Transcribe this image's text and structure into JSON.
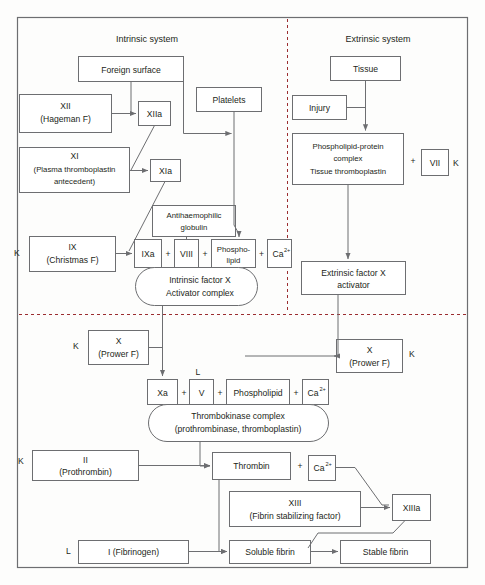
{
  "diagram": {
    "headings": {
      "intrinsic": "Intrinsic system",
      "extrinsic": "Extrinsic system"
    },
    "colors": {
      "box_stroke": "#6d6e71",
      "divider": "#9b2d30",
      "text": "#231f20",
      "background": "#fdfdfc"
    },
    "nodes": {
      "foreign_surface": "Foreign surface",
      "xii": "XII",
      "xii_sub": "(Hageman F)",
      "xiia": "XIIa",
      "platelets": "Platelets",
      "xi": "XI",
      "xi_sub1": "(Plasma thromboplastin",
      "xi_sub2": "antecedent)",
      "xia": "XIa",
      "antihaemophilic1": "Antihaemophilic",
      "antihaemophilic2": "globulin",
      "ix": "IX",
      "ix_sub": "(Christmas F)",
      "ixa": "IXa",
      "viii": "VIII",
      "phospho1": "Phospho-",
      "phospho2": "lipid",
      "ca_intrinsic": "Ca",
      "ca_sup": "2+",
      "intrinsic_complex1": "Intrinsic factor X",
      "intrinsic_complex2": "Activator complex",
      "tissue": "Tissue",
      "injury": "Injury",
      "phospholipid_protein1": "Phospholipid-protein",
      "phospholipid_protein2": "complex",
      "phospholipid_protein3": "Tissue thromboplastin",
      "vii": "VII",
      "extrinsic_activator1": "Extrinsic factor X",
      "extrinsic_activator2": "activator",
      "x_left": "X",
      "x_left_sub": "(Prower F)",
      "x_right": "X",
      "x_right_sub": "(Prower F)",
      "xa": "Xa",
      "v": "V",
      "phospholipid": "Phospholipid",
      "ca_thrombo": "Ca",
      "thrombokinase1": "Thrombokinase complex",
      "thrombokinase2": "(prothrombinase, thromboplastin)",
      "ii": "II",
      "ii_sub": "(Prothrombin)",
      "thrombin": "Thrombin",
      "ca_thrombin": "Ca",
      "xiii": "XIII",
      "xiii_sub": "(Fibrin stabilizing factor)",
      "xiiia": "XIIIa",
      "i_fibrinogen": "I (Fibrinogen)",
      "soluble_fibrin": "Soluble fibrin",
      "stable_fibrin": "Stable fibrin"
    },
    "vitamin_labels": {
      "k_ix": "K",
      "k_vii": "K",
      "k_x_left": "K",
      "k_x_right": "K",
      "k_ii": "K",
      "l_v": "L",
      "l_fibrinogen": "L"
    },
    "plus_signs": {
      "p1": "+",
      "p2": "+",
      "p3": "+",
      "p4": "+",
      "p5": "+",
      "p6": "+",
      "p7": "+",
      "p8": "+"
    }
  }
}
